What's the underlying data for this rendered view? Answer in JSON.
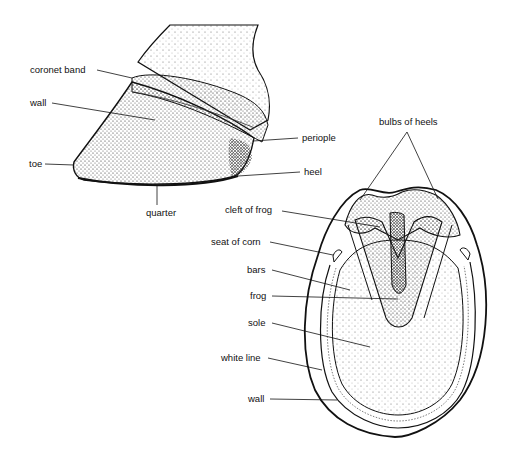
{
  "diagram": {
    "side_view": {
      "labels": {
        "coronet_band": "coronet band",
        "wall": "wall",
        "toe": "toe",
        "quarter": "quarter",
        "periople": "periople",
        "heel": "heel"
      }
    },
    "sole_view": {
      "labels": {
        "bulbs_of_heels": "bulbs of heels",
        "cleft_of_frog": "cleft of frog",
        "seat_of_corn": "seat of corn",
        "bars": "bars",
        "frog": "frog",
        "sole": "sole",
        "white_line": "white line",
        "wall": "wall"
      }
    },
    "colors": {
      "ink": "#111111",
      "background": "#ffffff"
    }
  }
}
